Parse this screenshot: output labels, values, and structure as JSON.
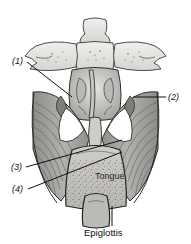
{
  "figure": {
    "kind": "anatomical-illustration",
    "style": "grayscale pen-and-ink medical drawing",
    "background_color": "#ffffff",
    "ink_color": "#1a1a1a",
    "tones": {
      "bone_light": "#e2e0dc",
      "mucosa_mid": "#c6c4c0",
      "muscle_mid": "#9c9a96",
      "shadow_dark": "#6e6c69",
      "highlight": "#f2f1ef"
    }
  },
  "callouts": [
    {
      "id": "callout-1",
      "label": "(1)",
      "x": 12,
      "y": 57,
      "leader_to": [
        72,
        97
      ]
    },
    {
      "id": "callout-2",
      "label": "(2)",
      "x": 168,
      "y": 93,
      "leader_to": [
        133,
        97
      ]
    },
    {
      "id": "callout-3",
      "label": "(3)",
      "x": 11,
      "y": 163,
      "leader_to": [
        122,
        140
      ]
    },
    {
      "id": "callout-4",
      "label": "(4)",
      "x": 12,
      "y": 185,
      "leader_to": [
        122,
        152
      ]
    }
  ],
  "text_labels": [
    {
      "id": "tongue-label",
      "text": "Tongue",
      "x": 95,
      "y": 172
    },
    {
      "id": "epiglottis-label",
      "text": "Epiglottis",
      "x": 84,
      "y": 228,
      "leader_from": [
        112,
        206
      ],
      "leader_to": [
        112,
        226
      ]
    }
  ]
}
